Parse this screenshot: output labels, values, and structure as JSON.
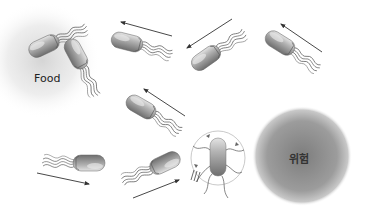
{
  "diagram": {
    "topic": "bacterial chemotaxis",
    "labels": {
      "food": "Food",
      "danger": "위험"
    },
    "zones": [
      {
        "name": "food-zone",
        "cx": 42,
        "cy": 60,
        "r": 55,
        "color": "#d8d8d8"
      },
      {
        "name": "danger-zone",
        "cx": 302,
        "cy": 156,
        "r": 48,
        "color": "#8a8a8a"
      }
    ],
    "bacteria": [
      {
        "name": "bacterium-1",
        "x": 40,
        "y": 47,
        "angle": -25
      },
      {
        "name": "bacterium-2",
        "x": 79,
        "y": 58,
        "angle": 60
      },
      {
        "name": "bacterium-3",
        "x": 125,
        "y": 42,
        "angle": 15
      },
      {
        "name": "bacterium-4",
        "x": 206,
        "y": 58,
        "angle": -35
      },
      {
        "name": "bacterium-5",
        "x": 280,
        "y": 43,
        "angle": 30
      },
      {
        "name": "bacterium-6",
        "x": 141,
        "y": 106,
        "angle": 30
      },
      {
        "name": "bacterium-7",
        "x": 87,
        "y": 164,
        "angle": 5
      },
      {
        "name": "bacterium-8",
        "x": 163,
        "y": 165,
        "angle": -25
      },
      {
        "name": "bacterium-9",
        "x": 218,
        "y": 160,
        "angle": 90
      }
    ],
    "arrows": [
      {
        "name": "arrow-1",
        "x1": 172,
        "y1": 36,
        "x2": 121,
        "y2": 22
      },
      {
        "name": "arrow-2",
        "x1": 232,
        "y1": 19,
        "x2": 187,
        "y2": 48
      },
      {
        "name": "arrow-3",
        "x1": 322,
        "y1": 52,
        "x2": 281,
        "y2": 24
      },
      {
        "name": "arrow-4",
        "x1": 185,
        "y1": 116,
        "x2": 144,
        "y2": 89
      },
      {
        "name": "arrow-5",
        "x1": 37,
        "y1": 173,
        "x2": 89,
        "y2": 184
      },
      {
        "name": "arrow-6",
        "x1": 133,
        "y1": 198,
        "x2": 179,
        "y2": 180
      }
    ],
    "colors": {
      "cell": "#9a9a9a",
      "cell_highlight": "#e0e0e0",
      "flagella": "#555555",
      "arrow": "#333333"
    }
  }
}
